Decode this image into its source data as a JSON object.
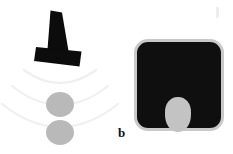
{
  "figure": {
    "caption_labels": [
      "b"
    ],
    "background_color": "#ffffff",
    "width": 233,
    "height": 154
  },
  "panel_a": {
    "name": "transducer-and-beam",
    "transducer": {
      "label": "ultrasound-transducer",
      "color": "#0d0c0c",
      "description": "black trapezoidal probe body with wide footplate, tilted slightly"
    },
    "beam": {
      "label": "ultrasound-beam-arcs",
      "arc_count": 3,
      "color": "#f0f0f0",
      "description": "three faint concentric arcs fanning downward from the probe face"
    },
    "targets": [
      {
        "label": "target-upper",
        "color": "#b9b9b9",
        "shape": "circle"
      },
      {
        "label": "target-lower",
        "color": "#b9b9b9",
        "shape": "circle"
      }
    ]
  },
  "panel_b": {
    "name": "ultrasound-image",
    "label": "b",
    "frame": {
      "fill_color": "#100f0f",
      "border_color": "#c9c9c9",
      "corner_radius": "14px",
      "description": "dark rounded-square B-mode ultrasound field of view"
    },
    "lesion": {
      "label": "hyperechoic-lesion",
      "color": "#c3c3c3",
      "shape": "oval",
      "description": "light grey oval inclusion in the lower-centre of the field"
    }
  },
  "artifacts": [
    {
      "label": "scan-artifact",
      "color": "#ededed"
    }
  ]
}
